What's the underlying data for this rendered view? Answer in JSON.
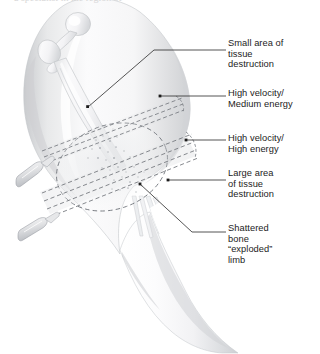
{
  "figure": {
    "background_color": "#ffffff",
    "ink_color": "#1c1c1c",
    "skin_fill": "#f4f4f5",
    "skin_shade": "#d9dadc",
    "bone_fill": "#f7f7f8",
    "dash_color": "#8d9096",
    "leader_color": "#2a2a2a",
    "cropped_text_top": "a specialist in the region of"
  },
  "anatomy": {
    "limb_label": "thigh-and-knee",
    "bone_label": "proximal-femur",
    "parts": [
      "femoral-head",
      "femoral-neck",
      "greater-trochanter",
      "femoral-shaft",
      "thigh-soft-tissue",
      "knee",
      "lower-leg"
    ]
  },
  "wound_tracts": [
    {
      "name": "upper-tract",
      "description": "High velocity / Medium energy — narrow dashed wound tract",
      "style": "dashed",
      "projectile": true
    },
    {
      "name": "lower-tract",
      "description": "High velocity / High energy — wide dashed wound tract",
      "style": "dashed",
      "projectile": true
    }
  ],
  "cavity": {
    "name": "temporary-cavity",
    "description": "Large dashed ellipse marking the zone of tissue destruction",
    "style": "dashed"
  },
  "labels": [
    {
      "id": "small-area-tissue-destruction",
      "text": "Small area of\ntissue\ndestruction",
      "x": 228,
      "y": 38,
      "leader": "elbow-down-left-to-upper-tract"
    },
    {
      "id": "high-velocity-medium-energy",
      "text": "High velocity/\nMedium energy",
      "x": 228,
      "y": 88,
      "leader": "straight-left-to-upper-tract"
    },
    {
      "id": "high-velocity-high-energy",
      "text": "High velocity/\nHigh energy",
      "x": 228,
      "y": 133,
      "leader": "straight-left-to-lower-tract"
    },
    {
      "id": "large-area-tissue-destruction",
      "text": "Large area\nof tissue\ndestruction",
      "x": 228,
      "y": 168,
      "leader": "straight-left-to-cavity"
    },
    {
      "id": "shattered-bone-exploded-limb",
      "text": "Shattered\nbone\n“exploded”\nlimb",
      "x": 228,
      "y": 223,
      "leader": "diagonal-up-left-to-bone-fragments"
    }
  ]
}
